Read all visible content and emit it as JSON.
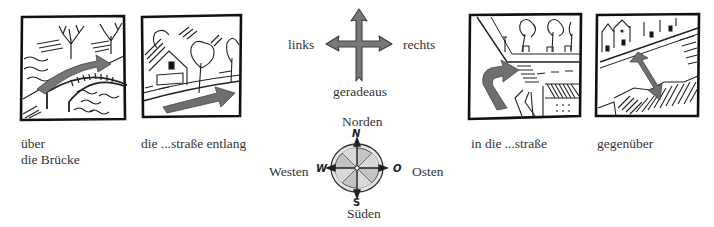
{
  "panels": [
    {
      "id": "bridge",
      "label_line1": "über",
      "label_line2": "die Brücke"
    },
    {
      "id": "along-street",
      "label": "die ...straße entlang"
    },
    {
      "id": "into-street",
      "label": "in die ...straße"
    },
    {
      "id": "opposite",
      "label": "gegenüber"
    }
  ],
  "directions": {
    "left": "links",
    "right": "rechts",
    "straight": "geradeaus"
  },
  "compass": {
    "north": "Norden",
    "south": "Süden",
    "west": "Westen",
    "east": "Osten",
    "north_letter": "N",
    "south_letter": "S",
    "west_letter": "W",
    "east_letter": "O"
  },
  "colors": {
    "arrow_gray": "#7a7a7a",
    "ink": "#1a1a1a",
    "compass_fill": "#c8c8c8"
  }
}
